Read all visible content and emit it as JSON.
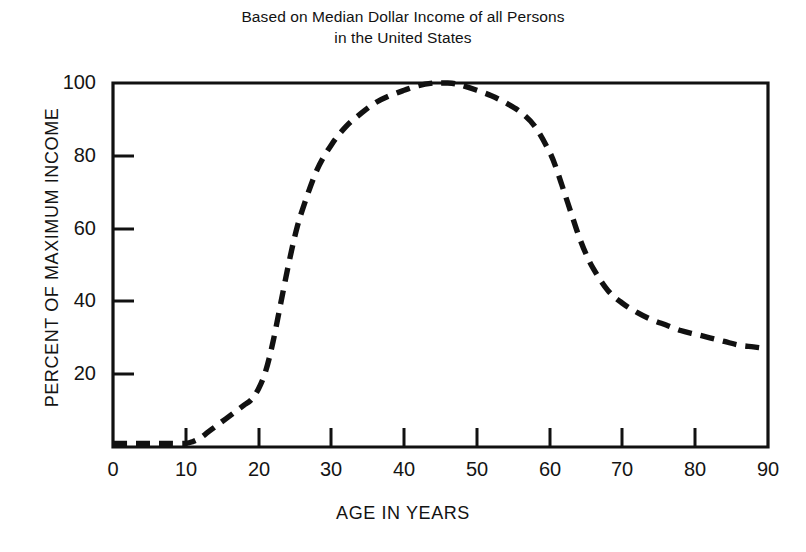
{
  "title": {
    "line1": "Based on Median Dollar Income of all Persons",
    "line2": "in the United States"
  },
  "axes": {
    "x_title": "AGE IN YEARS",
    "y_title": "PERCENT OF MAXIMUM INCOME",
    "x_ticks": [
      "0",
      "10",
      "20",
      "30",
      "40",
      "50",
      "60",
      "70",
      "80",
      "90"
    ],
    "y_ticks": [
      "20",
      "40",
      "60",
      "80",
      "100"
    ],
    "origin_label": "0"
  },
  "chart_data": {
    "type": "line",
    "title": "Based on Median Dollar Income of all Persons in the United States",
    "subtitle": "",
    "xlabel": "AGE IN YEARS",
    "ylabel": "PERCENT OF MAXIMUM INCOME",
    "xlim": [
      0,
      90
    ],
    "ylim": [
      0,
      100
    ],
    "xtick_values": [
      0,
      10,
      20,
      30,
      40,
      50,
      60,
      70,
      80,
      90
    ],
    "ytick_values": [
      0,
      20,
      40,
      60,
      80,
      100
    ],
    "grid": false,
    "legend": "none",
    "line_style": "dashed",
    "line_color": "#111111",
    "series": [
      {
        "name": "Percent of maximum income",
        "x": [
          0,
          2,
          4,
          6,
          8,
          10,
          11,
          12,
          13,
          14,
          15,
          16,
          17,
          18,
          19,
          20,
          21,
          22,
          23,
          24,
          25,
          26,
          28,
          30,
          32,
          34,
          36,
          38,
          40,
          42,
          44,
          45,
          46,
          47,
          48,
          50,
          52,
          54,
          56,
          58,
          60,
          61,
          62,
          63,
          64,
          65,
          66,
          68,
          70,
          72,
          74,
          76,
          78,
          80,
          82,
          84,
          86,
          88,
          90
        ],
        "y": [
          1,
          1,
          1,
          1,
          1,
          1,
          1.5,
          2.5,
          4,
          5.5,
          7,
          8.5,
          10,
          11.5,
          13,
          16,
          21,
          29,
          39,
          49,
          58,
          65,
          76,
          83,
          88,
          91.5,
          94.5,
          96.5,
          98,
          99.3,
          100,
          100,
          100,
          99.8,
          99.3,
          98,
          96.5,
          94.5,
          92,
          88,
          81,
          76,
          70,
          64,
          58,
          53,
          49,
          43,
          39.5,
          37,
          35,
          33.5,
          32,
          31,
          30,
          29,
          28,
          27.5,
          27
        ]
      }
    ],
    "annotations": [
      "Income is near zero from birth through about age 11",
      "Income rises steeply between ages 18 and 30",
      "Peak of 100 percent occurs at about age 45",
      "Sharp decline between ages 58 and 66 at retirement",
      "Levels off near 27 percent by age 90"
    ]
  }
}
